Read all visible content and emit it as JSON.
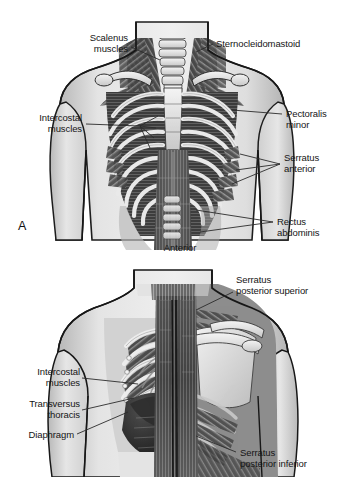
{
  "figure": {
    "type": "anatomical-illustration",
    "style": "grayscale medical illustration",
    "background_color": "#ffffff",
    "panels": [
      {
        "id": "A",
        "letter": "A",
        "view_caption": "Anterior",
        "description": "Anterior view of thorax showing ribcage, sternum and respiratory muscles"
      },
      {
        "id": "B",
        "letter": "",
        "view_caption": "",
        "description": "Posterior and cut-away view of thorax showing scapula, spine, diaphragm and serratus posterior muscles"
      }
    ]
  },
  "labels_top": {
    "scalenus": "Scalenus\nmuscles",
    "sternocleidomastoid": "Sternocleidomastoid",
    "intercostal": "Intercostal\nmuscles",
    "pectoralis_minor": "Pectoralis\nminor",
    "serratus_anterior": "Serratus\nanterior",
    "rectus_abdominis": "Rectus\nabdominis",
    "anterior": "Anterior",
    "panel_letter": "A"
  },
  "labels_bottom": {
    "serratus_posterior_superior": "Serratus\nposterior superior",
    "intercostal": "Intercostal\nmuscles",
    "transversus_thoracis": "Transversus\nthoracis",
    "diaphragm": "Diaphragm",
    "serratus_posterior_inferior": "Serratus\nposterior inferior"
  },
  "colors": {
    "leader_line": "#2b2b2b",
    "text": "#151515",
    "skin_light": "#e8e8e8",
    "skin_mid": "#c9c9c9",
    "bone_light": "#efefef",
    "muscle_dark": "#3a3a3a",
    "muscle_mid": "#6e6e6e",
    "shadow": "#1e1e1e"
  }
}
